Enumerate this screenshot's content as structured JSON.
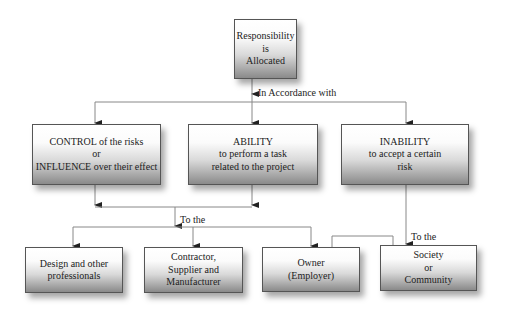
{
  "diagram": {
    "root": {
      "lines": [
        "Responsibility",
        "is",
        "Allocated"
      ]
    },
    "connector_labels": {
      "in_accordance": "In Accordance with",
      "to_the_left": "To the",
      "to_the_right": "To the"
    },
    "criteria": [
      {
        "id": "control",
        "lines": [
          "CONTROL of the risks",
          "or",
          "INFLUENCE over their effect"
        ]
      },
      {
        "id": "ability",
        "lines": [
          "ABILITY",
          "to perform a task",
          "related to the project"
        ]
      },
      {
        "id": "inability",
        "lines": [
          "INABILITY",
          "to accept a certain",
          "risk"
        ]
      }
    ],
    "parties": [
      {
        "id": "design",
        "lines": [
          "Design and other",
          "professionals"
        ]
      },
      {
        "id": "contractor",
        "lines": [
          "Contractor,",
          "Supplier and",
          "Manufacturer"
        ]
      },
      {
        "id": "owner",
        "lines": [
          "Owner",
          "(Employer)"
        ]
      },
      {
        "id": "society",
        "lines": [
          "Society",
          "or",
          "Community"
        ]
      }
    ],
    "colors": {
      "line": "#777777",
      "border": "#555555",
      "gradient_dark": "#8a8a8a"
    }
  }
}
